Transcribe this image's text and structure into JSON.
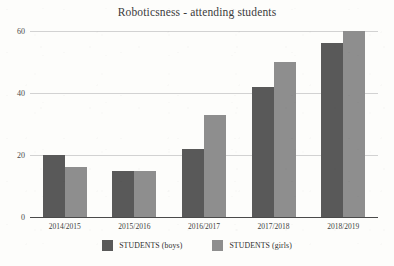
{
  "chart_data": {
    "type": "bar",
    "title": "Roboticsness - attending students",
    "xlabel": "",
    "ylabel": "",
    "categories": [
      "2014/2015",
      "2015/2016",
      "2016/2017",
      "2017/2018",
      "2018/2019"
    ],
    "series": [
      {
        "name": "STUDENTS (boys)",
        "values": [
          20,
          15,
          22,
          42,
          56
        ],
        "color": "#595959"
      },
      {
        "name": "STUDENTS (girls)",
        "values": [
          16,
          15,
          33,
          50,
          60
        ],
        "color": "#8e8e8e"
      }
    ],
    "ylim": [
      0,
      60
    ],
    "yticks": [
      0,
      20,
      40,
      60
    ],
    "ytick_labels": [
      "0",
      "20",
      "40",
      "60"
    ],
    "grid": true,
    "legend_position": "bottom"
  },
  "legend": {
    "items": [
      {
        "label": "STUDENTS (boys)",
        "swatch": "boys"
      },
      {
        "label": "STUDENTS (girls)",
        "swatch": "girls"
      }
    ]
  }
}
